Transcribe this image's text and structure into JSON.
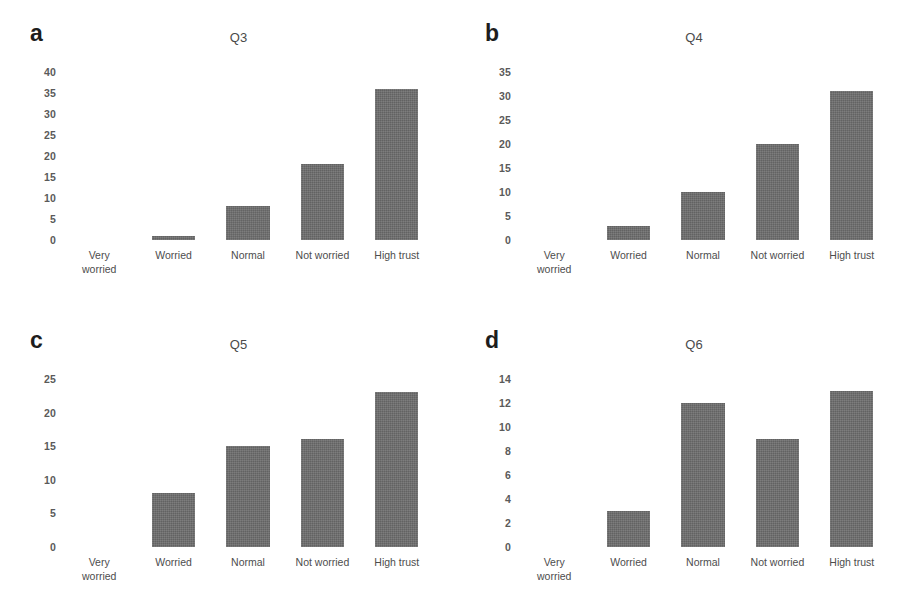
{
  "figure": {
    "background": "#ffffff",
    "bar_color": "#6e6e6e",
    "text_color": "#4d4d4d"
  },
  "panels": [
    {
      "letter": "a",
      "title": "Q3",
      "yticks": [
        "40",
        "35",
        "30",
        "25",
        "20",
        "15",
        "10",
        "5",
        "0"
      ],
      "categories": [
        "Very\nworried",
        "Worried",
        "Normal",
        "Not worried",
        "High trust"
      ],
      "values": [
        0,
        1,
        8,
        18,
        36
      ],
      "ymax": 40
    },
    {
      "letter": "b",
      "title": "Q4",
      "yticks": [
        "35",
        "30",
        "25",
        "20",
        "15",
        "10",
        "5",
        "0"
      ],
      "categories": [
        "Very\nworried",
        "Worried",
        "Normal",
        "Not worried",
        "High trust"
      ],
      "values": [
        0,
        3,
        10,
        20,
        31
      ],
      "ymax": 35
    },
    {
      "letter": "c",
      "title": "Q5",
      "yticks": [
        "25",
        "20",
        "15",
        "10",
        "5",
        "0"
      ],
      "categories": [
        "Very\nworried",
        "Worried",
        "Normal",
        "Not worried",
        "High trust"
      ],
      "values": [
        0,
        8,
        15,
        16,
        23
      ],
      "ymax": 25
    },
    {
      "letter": "d",
      "title": "Q6",
      "yticks": [
        "14",
        "12",
        "10",
        "8",
        "6",
        "4",
        "2",
        "0"
      ],
      "categories": [
        "Very\nworried",
        "Worried",
        "Normal",
        "Not worried",
        "High trust"
      ],
      "values": [
        0,
        3,
        12,
        9,
        13
      ],
      "ymax": 14
    }
  ],
  "chart_data": [
    {
      "type": "bar",
      "title": "Q3",
      "panel": "a",
      "categories": [
        "Very worried",
        "Worried",
        "Normal",
        "Not worried",
        "High trust"
      ],
      "values": [
        0,
        1,
        8,
        18,
        36
      ],
      "xlabel": "",
      "ylabel": "",
      "ylim": [
        0,
        40
      ],
      "ytick_step": 5,
      "grid": false,
      "legend": false
    },
    {
      "type": "bar",
      "title": "Q4",
      "panel": "b",
      "categories": [
        "Very worried",
        "Worried",
        "Normal",
        "Not worried",
        "High trust"
      ],
      "values": [
        0,
        3,
        10,
        20,
        31
      ],
      "xlabel": "",
      "ylabel": "",
      "ylim": [
        0,
        35
      ],
      "ytick_step": 5,
      "grid": false,
      "legend": false
    },
    {
      "type": "bar",
      "title": "Q5",
      "panel": "c",
      "categories": [
        "Very worried",
        "Worried",
        "Normal",
        "Not worried",
        "High trust"
      ],
      "values": [
        0,
        8,
        15,
        16,
        23
      ],
      "xlabel": "",
      "ylabel": "",
      "ylim": [
        0,
        25
      ],
      "ytick_step": 5,
      "grid": false,
      "legend": false
    },
    {
      "type": "bar",
      "title": "Q6",
      "panel": "d",
      "categories": [
        "Very worried",
        "Worried",
        "Normal",
        "Not worried",
        "High trust"
      ],
      "values": [
        0,
        3,
        12,
        9,
        13
      ],
      "xlabel": "",
      "ylabel": "",
      "ylim": [
        0,
        14
      ],
      "ytick_step": 2,
      "grid": false,
      "legend": false
    }
  ]
}
